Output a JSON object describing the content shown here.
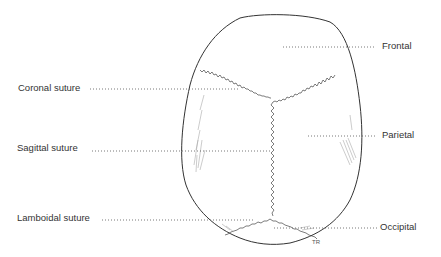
{
  "diagram": {
    "labels": {
      "frontal": "Frontal",
      "coronal_suture": "Coronal suture",
      "parietal": "Parietal",
      "sagittal_suture": "Sagittal suture",
      "lamboidal_suture": "Lamboidal suture",
      "occipital": "Occipital"
    },
    "signature": "TR",
    "colors": {
      "outline": "#333333",
      "suture": "#444444",
      "leader": "#555555",
      "shading": "#aaaaaa"
    }
  }
}
